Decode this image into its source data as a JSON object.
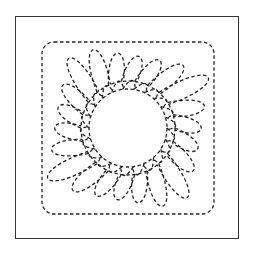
{
  "diagram": {
    "type": "quilting-pattern",
    "stroke_color": "#222222",
    "frame_color": "#333333",
    "background": "#ffffff",
    "center": [
      128,
      128
    ],
    "inner_radius": 33,
    "outer_square": [
      42,
      42,
      214,
      214
    ],
    "feather_count": 22
  }
}
